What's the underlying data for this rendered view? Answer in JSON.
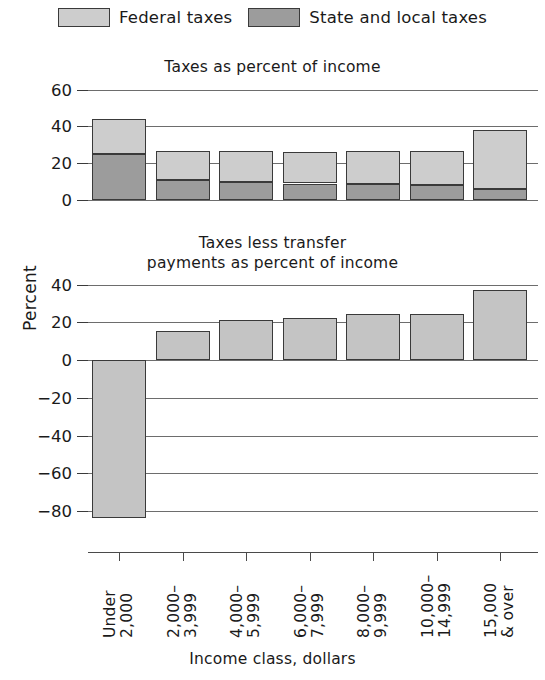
{
  "legend": {
    "items": [
      {
        "label": "Federal taxes",
        "color": "#cdcdcd",
        "icon": "legend-swatch-icon"
      },
      {
        "label": "State and local taxes",
        "color": "#9c9c9c",
        "icon": "legend-swatch-icon"
      }
    ]
  },
  "axis": {
    "ylabel": "Percent",
    "xlabel": "Income class, dollars"
  },
  "chart_data": [
    {
      "type": "bar",
      "title": "Taxes as percent of income",
      "stacked": true,
      "xlabel": "Income class, dollars",
      "ylabel": "Percent",
      "ylim": [
        0,
        60
      ],
      "yticks": [
        0,
        20,
        40,
        60
      ],
      "ytick_labels": [
        "0",
        "20",
        "40",
        "60"
      ],
      "grid": true,
      "categories": [
        "Under 2,000",
        "2,000-3,999",
        "4,000-5,999",
        "6,000-7,999",
        "8,000-9,999",
        "10,000-14,999",
        "15,000 & over"
      ],
      "series": [
        {
          "name": "State and local taxes",
          "color": "#9c9c9c",
          "values": [
            25.0,
            11.0,
            10.0,
            9.0,
            8.5,
            8.0,
            6.0
          ]
        },
        {
          "name": "Federal taxes",
          "color": "#cdcdcd",
          "values": [
            19.0,
            16.0,
            16.5,
            17.0,
            18.5,
            19.0,
            32.0
          ]
        }
      ],
      "totals": [
        44.0,
        27.0,
        26.5,
        26.0,
        27.0,
        27.0,
        38.0
      ]
    },
    {
      "type": "bar",
      "title_line1": "Taxes less transfer",
      "title_line2": "payments as percent of income",
      "title": "Taxes less transfer payments as percent of income",
      "stacked": false,
      "xlabel": "Income class, dollars",
      "ylabel": "Percent",
      "ylim": [
        -90,
        40
      ],
      "yticks": [
        40,
        20,
        0,
        -20,
        -40,
        -60,
        -80
      ],
      "ytick_labels": [
        "40",
        "20",
        "0",
        "−20",
        "−40",
        "−60",
        "−80"
      ],
      "grid": true,
      "categories": [
        "Under 2,000",
        "2,000-3,999",
        "4,000-5,999",
        "6,000-7,999",
        "8,000-9,999",
        "10,000-14,999",
        "15,000 & over"
      ],
      "values": [
        -84.0,
        15.5,
        21.5,
        22.5,
        24.5,
        24.5,
        37.5
      ],
      "color": "#c4c4c4"
    }
  ],
  "xcategories": [
    {
      "line1": "Under",
      "line2": "2,000"
    },
    {
      "line1": "2,000–",
      "line2": "3,999"
    },
    {
      "line1": "4,000–",
      "line2": "5,999"
    },
    {
      "line1": "6,000–",
      "line2": "7,999"
    },
    {
      "line1": "8,000–",
      "line2": "9,999"
    },
    {
      "line1": "10,000–",
      "line2": "14,999"
    },
    {
      "line1": "15,000",
      "line2": "& over"
    }
  ],
  "upper": {
    "title": "Taxes as percent of income",
    "ytick_labels": [
      "60",
      "40",
      "20",
      "0"
    ]
  },
  "lower": {
    "title_line1": "Taxes less transfer",
    "title_line2": "payments as percent of income",
    "ytick_labels": [
      "40",
      "20",
      "0",
      "−20",
      "−40",
      "−60",
      "−80"
    ]
  }
}
